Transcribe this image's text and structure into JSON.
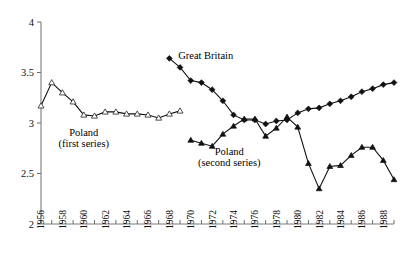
{
  "chart_data": {
    "type": "line",
    "title": "",
    "subtitle": "",
    "xlabel": "",
    "ylabel": "",
    "xlim": [
      1955.4,
      1989.8
    ],
    "ylim": [
      2,
      4
    ],
    "yticks": [
      2,
      2.5,
      3,
      3.5,
      4
    ],
    "ytick_labels": [
      "2",
      "2.5",
      "3",
      "3.5",
      "4"
    ],
    "xticks": [
      1956,
      1957,
      1958,
      1959,
      1960,
      1961,
      1962,
      1963,
      1964,
      1965,
      1966,
      1967,
      1968,
      1969,
      1970,
      1971,
      1972,
      1973,
      1974,
      1975,
      1976,
      1977,
      1978,
      1979,
      1980,
      1981,
      1982,
      1983,
      1984,
      1985,
      1986,
      1987,
      1988,
      1989
    ],
    "xtick_labels_shown": [
      "1956",
      "1958",
      "1960",
      "1962",
      "1964",
      "1966",
      "1968",
      "1970",
      "1972",
      "1974",
      "1976",
      "1978",
      "1980",
      "1982",
      "1984",
      "1986",
      "1988"
    ],
    "xtick_label_years": [
      1956,
      1958,
      1960,
      1962,
      1964,
      1966,
      1968,
      1970,
      1972,
      1974,
      1976,
      1978,
      1980,
      1982,
      1984,
      1986,
      1988
    ],
    "grid": false,
    "legend_position": "inline-annotations",
    "series": [
      {
        "name": "Poland (first series)",
        "marker": "open-triangle",
        "x": [
          1956,
          1957,
          1958,
          1959,
          1960,
          1961,
          1962,
          1963,
          1964,
          1965,
          1966,
          1967,
          1968,
          1969
        ],
        "values": [
          3.17,
          3.4,
          3.3,
          3.21,
          3.08,
          3.07,
          3.11,
          3.11,
          3.09,
          3.09,
          3.08,
          3.05,
          3.09,
          3.12
        ]
      },
      {
        "name": "Great Britain",
        "marker": "filled-diamond",
        "x": [
          1968,
          1969,
          1970,
          1971,
          1972,
          1973,
          1974,
          1975,
          1976,
          1977,
          1978,
          1979,
          1980,
          1981,
          1982,
          1983,
          1984,
          1985,
          1986,
          1987,
          1988,
          1989
        ],
        "values": [
          3.64,
          3.55,
          3.42,
          3.4,
          3.33,
          3.22,
          3.08,
          3.03,
          3.03,
          2.99,
          3.02,
          3.03,
          3.1,
          3.14,
          3.15,
          3.19,
          3.22,
          3.26,
          3.31,
          3.34,
          3.38,
          3.4
        ]
      },
      {
        "name": "Poland (second series)",
        "marker": "filled-triangle",
        "x": [
          1970,
          1971,
          1972,
          1973,
          1974,
          1975,
          1976,
          1977,
          1978,
          1979,
          1980,
          1981,
          1982,
          1983,
          1984,
          1985,
          1986,
          1987,
          1988,
          1989
        ],
        "values": [
          2.83,
          2.8,
          2.77,
          2.89,
          2.97,
          3.04,
          3.04,
          2.87,
          2.95,
          3.06,
          2.96,
          2.6,
          2.35,
          2.57,
          2.58,
          2.68,
          2.76,
          2.76,
          2.63,
          2.44
        ]
      }
    ],
    "annotations": [
      {
        "id": "great-britain",
        "text": "Great Britain",
        "x": 1971.4,
        "y": 3.63
      },
      {
        "id": "poland-first-1",
        "text": "Poland",
        "x": 1960.0,
        "y": 2.87
      },
      {
        "id": "poland-first-2",
        "text": "(first series)",
        "x": 1960.0,
        "y": 2.76
      },
      {
        "id": "poland-second-1",
        "text": "Poland",
        "x": 1973.6,
        "y": 2.68
      },
      {
        "id": "poland-second-2",
        "text": "(second series)",
        "x": 1973.6,
        "y": 2.57
      }
    ],
    "colors": {
      "series_line": "#111111",
      "axis": "#7d7d7d",
      "background": "#ffffff",
      "text": "#111111"
    }
  }
}
